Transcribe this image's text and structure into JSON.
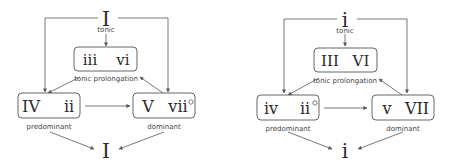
{
  "diagrams": [
    {
      "mode": "major",
      "tonic_top": "I",
      "tonic_label": "tonic",
      "prolongation": {
        "left": "iii",
        "right": "vi",
        "label": "tonic prolongation"
      },
      "predominant": {
        "left": "IV",
        "right": "ii",
        "right_sup": "",
        "label": "predominant"
      },
      "dominant": {
        "left": "V",
        "right": "vii",
        "right_sup": "o",
        "label": "dominant"
      },
      "tonic_bottom": "I"
    },
    {
      "mode": "minor",
      "tonic_top": "i",
      "tonic_label": "tonic",
      "prolongation": {
        "left": "III",
        "right": "VI",
        "label": "tonic prolongation"
      },
      "predominant": {
        "left": "iv",
        "right": "ii",
        "right_sup": "o",
        "label": "predominant"
      },
      "dominant": {
        "left": "v",
        "right": "VII",
        "right_sup": "",
        "label": "dominant"
      },
      "tonic_bottom": "i"
    }
  ]
}
